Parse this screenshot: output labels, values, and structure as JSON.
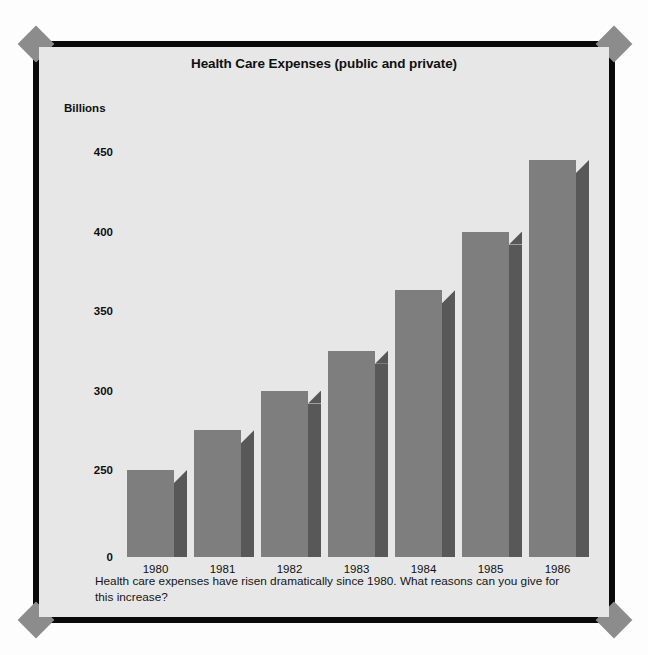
{
  "chart_data": {
    "type": "bar",
    "title": "Health Care Expenses (public and private)",
    "xlabel": "",
    "ylabel": "Billions",
    "categories": [
      "1980",
      "1981",
      "1982",
      "1983",
      "1984",
      "1985",
      "1986"
    ],
    "values": [
      250,
      275,
      300,
      325,
      363,
      400,
      445
    ],
    "ytick_labels": [
      "450",
      "400",
      "350",
      "300",
      "250",
      "0"
    ],
    "ytick_values": [
      450,
      400,
      350,
      300,
      250,
      0
    ],
    "ylim": [
      230,
      470
    ],
    "axis_broken": true,
    "grid": false,
    "legend": false,
    "style": "3d-bars",
    "bar_face_color": "#7e7e7e",
    "bar_side_color": "#585858",
    "bar_top_color": "#6a6a6a",
    "panel_color": "#e7e7e7",
    "frame_color": "#0a0a0a",
    "ornament_color": "#8c8c8c"
  },
  "caption": {
    "text": "Health care expenses have risen dramatically since 1980. What reasons can you give for this increase?"
  }
}
